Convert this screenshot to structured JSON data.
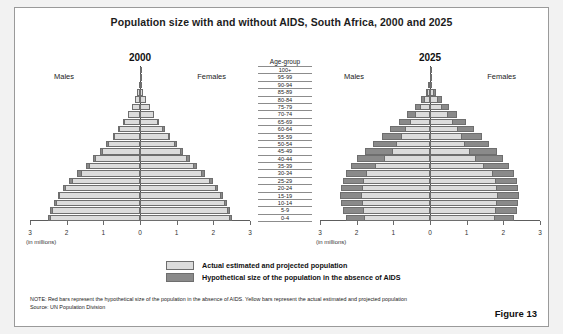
{
  "figure": {
    "title": "Population size with and without AIDS, South Africa, 2000 and 2025",
    "label": "Figure 13"
  },
  "age_column": {
    "header": "Age-group",
    "groups": [
      "100+",
      "95-99",
      "90-94",
      "85-89",
      "80-84",
      "75-79",
      "70-74",
      "65-69",
      "60-64",
      "55-59",
      "50-54",
      "45-49",
      "40-44",
      "35-39",
      "30-34",
      "25-29",
      "20-24",
      "15-19",
      "10-14",
      "5-9",
      "0-4"
    ]
  },
  "panels": {
    "left": {
      "year": "2000",
      "males_label": "Males",
      "females_label": "Females",
      "units": "(in millions)",
      "tick_labels": [
        "3",
        "2",
        "1",
        "0",
        "1",
        "2",
        "3"
      ]
    },
    "right": {
      "year": "2025",
      "males_label": "Males",
      "females_label": "Females",
      "units": "(in millions)",
      "tick_labels": [
        "3",
        "2",
        "1",
        "0",
        "1",
        "2",
        "3"
      ]
    }
  },
  "legend": {
    "items": [
      {
        "key": "actual",
        "label": "Actual estimated and projected population",
        "color": "#dcdcdc"
      },
      {
        "key": "hypothetical",
        "label": "Hypothetical size of the population in the absence of AIDS",
        "color": "#8a8a8a"
      }
    ]
  },
  "note": {
    "line1": "NOTE: Red bars represent the hypothetical size of the population in the absence of AIDS. Yellow bars represent the actual estimated and projected population",
    "line2": "Source: UN Population Division"
  },
  "chart_data": {
    "type": "bar",
    "subtype": "population-pyramid",
    "title": "Population size with and without AIDS, South Africa, 2000 and 2025",
    "xlabel": "(in millions)",
    "ylabel": "Age-group",
    "xlim": [
      -3,
      3
    ],
    "xticks": [
      -3,
      -2,
      -1,
      0,
      1,
      2,
      3
    ],
    "xticklabels": [
      "3",
      "2",
      "1",
      "0",
      "1",
      "2",
      "3"
    ],
    "grid": false,
    "legend_position": "bottom-center",
    "categories": [
      "0-4",
      "5-9",
      "10-14",
      "15-19",
      "20-24",
      "25-29",
      "30-34",
      "35-39",
      "40-44",
      "45-49",
      "50-54",
      "55-59",
      "60-64",
      "65-69",
      "70-74",
      "75-79",
      "80-84",
      "85-89",
      "90-94",
      "95-99",
      "100+"
    ],
    "panels": [
      {
        "name": "2000",
        "series": [
          {
            "name": "Males actual estimated and projected population",
            "side": "left",
            "values": [
              2.45,
              2.4,
              2.3,
              2.2,
              2.05,
              1.85,
              1.62,
              1.4,
              1.22,
              1.05,
              0.88,
              0.72,
              0.58,
              0.45,
              0.33,
              0.22,
              0.13,
              0.07,
              0.03,
              0.01,
              0.003
            ]
          },
          {
            "name": "Males hypothetical size in the absence of AIDS",
            "side": "left",
            "values": [
              2.52,
              2.46,
              2.35,
              2.25,
              2.11,
              1.93,
              1.71,
              1.48,
              1.28,
              1.1,
              0.92,
              0.75,
              0.6,
              0.47,
              0.34,
              0.23,
              0.14,
              0.075,
              0.032,
              0.011,
              0.004
            ]
          },
          {
            "name": "Females actual estimated and projected population",
            "side": "right",
            "values": [
              2.45,
              2.4,
              2.32,
              2.22,
              2.08,
              1.9,
              1.68,
              1.46,
              1.28,
              1.12,
              0.95,
              0.79,
              0.64,
              0.5,
              0.37,
              0.26,
              0.16,
              0.09,
              0.04,
              0.013,
              0.004
            ]
          },
          {
            "name": "Females hypothetical size in the absence of AIDS",
            "side": "right",
            "values": [
              2.52,
              2.46,
              2.37,
              2.27,
              2.14,
              1.98,
              1.77,
              1.55,
              1.35,
              1.18,
              1.0,
              0.83,
              0.67,
              0.53,
              0.39,
              0.27,
              0.17,
              0.095,
              0.043,
              0.014,
              0.005
            ]
          }
        ]
      },
      {
        "name": "2025",
        "series": [
          {
            "name": "Males actual estimated and projected population",
            "side": "left",
            "values": [
              1.8,
              1.82,
              1.85,
              1.88,
              1.86,
              1.82,
              1.75,
              1.5,
              1.25,
              1.05,
              0.92,
              0.8,
              0.68,
              0.55,
              0.42,
              0.28,
              0.17,
              0.08,
              0.03,
              0.008,
              0.002
            ]
          },
          {
            "name": "Males hypothetical size in the absence of AIDS",
            "side": "left",
            "values": [
              2.3,
              2.38,
              2.42,
              2.45,
              2.42,
              2.38,
              2.3,
              2.15,
              1.98,
              1.78,
              1.55,
              1.32,
              1.08,
              0.85,
              0.62,
              0.42,
              0.25,
              0.12,
              0.045,
              0.012,
              0.003
            ]
          },
          {
            "name": "Females actual estimated and projected population",
            "side": "right",
            "values": [
              1.78,
              1.8,
              1.83,
              1.86,
              1.84,
              1.8,
              1.72,
              1.48,
              1.25,
              1.08,
              0.96,
              0.86,
              0.75,
              0.62,
              0.48,
              0.34,
              0.21,
              0.11,
              0.04,
              0.011,
              0.003
            ]
          },
          {
            "name": "Females hypothetical size in the absence of AIDS",
            "side": "right",
            "values": [
              2.28,
              2.36,
              2.4,
              2.43,
              2.4,
              2.36,
              2.3,
              2.16,
              2.0,
              1.82,
              1.62,
              1.42,
              1.2,
              0.98,
              0.74,
              0.52,
              0.33,
              0.17,
              0.065,
              0.018,
              0.004
            ]
          }
        ]
      }
    ]
  }
}
